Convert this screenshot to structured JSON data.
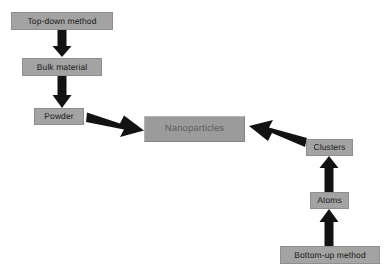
{
  "diagram": {
    "background_color": "#ffffff",
    "node_fill_color": "#a3a3a3",
    "primary_node_fill_color": "#9b9b9b",
    "arrow_color": "#121212",
    "nodes": [
      {
        "id": "top-down-method",
        "label": "Top-down method"
      },
      {
        "id": "bulk-material",
        "label": "Bulk material"
      },
      {
        "id": "powder",
        "label": "Powder"
      },
      {
        "id": "nanoparticles",
        "label": "Nanoparticles"
      },
      {
        "id": "clusters",
        "label": "Clusters"
      },
      {
        "id": "atoms",
        "label": "Atoms"
      },
      {
        "id": "bottom-up-method",
        "label": "Bottom-up method"
      }
    ],
    "edges": [
      {
        "id": "top-down-to-bulk",
        "from": "top-down-method",
        "to": "bulk-material",
        "direction": "down"
      },
      {
        "id": "bulk-to-powder",
        "from": "bulk-material",
        "to": "powder",
        "direction": "down"
      },
      {
        "id": "powder-to-nanoparticles",
        "from": "powder",
        "to": "nanoparticles",
        "direction": "right-down"
      },
      {
        "id": "clusters-to-nanoparticles",
        "from": "clusters",
        "to": "nanoparticles",
        "direction": "left-up"
      },
      {
        "id": "atoms-to-clusters",
        "from": "atoms",
        "to": "clusters",
        "direction": "up"
      },
      {
        "id": "bottom-up-to-atoms",
        "from": "bottom-up-method",
        "to": "atoms",
        "direction": "up"
      }
    ]
  }
}
